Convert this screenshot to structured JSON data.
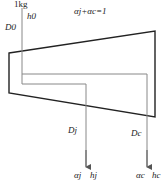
{
  "diagram": {
    "input": {
      "mass_label": "1kg",
      "enthalpy_label": "h0",
      "flow_label": "D0"
    },
    "equation": "αj+αc=1",
    "outputs": [
      {
        "flow_label": "Dj",
        "fraction": "αj",
        "enthalpy": "hj"
      },
      {
        "flow_label": "Dc",
        "fraction": "αc",
        "enthalpy": "hc"
      }
    ],
    "colors": {
      "vessel": "#222222",
      "flow": "#888888",
      "text": "#222222"
    }
  }
}
